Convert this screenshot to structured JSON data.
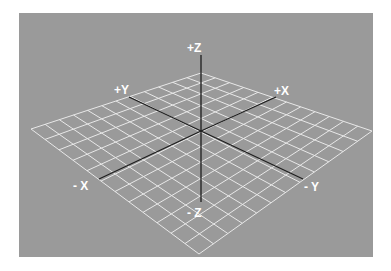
{
  "diagram": {
    "colors": {
      "page_background": "#ffffff",
      "panel_background": "#9a9a9a",
      "grid_lines": "#e8e8e8",
      "axis_lines": "#1e1e1e",
      "label_text": "#ffffff"
    },
    "panel": {
      "x": 19,
      "y": 13,
      "width": 354,
      "height": 244
    },
    "grid": {
      "divisions": 12,
      "corners": {
        "top": [
          201,
          73
        ],
        "right": [
          372,
          131
        ],
        "bottom": [
          199,
          254
        ],
        "left": [
          31,
          129
        ]
      }
    },
    "origin": [
      201,
      131
    ],
    "axes": [
      {
        "name": "+Z",
        "end": [
          201,
          55
        ],
        "label_pos": [
          198,
          51
        ]
      },
      {
        "name": "-Z",
        "end": [
          201,
          202
        ],
        "label_pos": [
          198,
          216
        ]
      },
      {
        "name": "+Y",
        "end": [
          129,
          97
        ],
        "label_pos": [
          122,
          93
        ]
      },
      {
        "name": "-Y",
        "end": [
          303,
          179
        ],
        "label_pos": [
          315,
          190
        ]
      },
      {
        "name": "+X",
        "end": [
          276,
          97
        ],
        "label_pos": [
          285,
          94
        ]
      },
      {
        "name": "-X",
        "end": [
          99,
          179
        ],
        "label_pos": [
          80,
          189
        ]
      }
    ],
    "labels": {
      "plus_z": "+Z",
      "minus_z": "- Z",
      "plus_y": "+Y",
      "minus_y": "- Y",
      "plus_x": "+X",
      "minus_x": "- X"
    }
  }
}
